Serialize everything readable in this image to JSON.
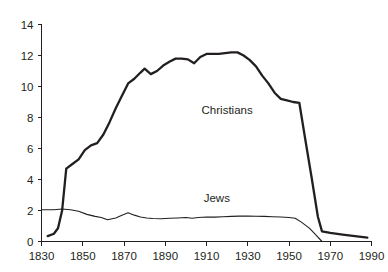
{
  "chart_data": {
    "type": "line",
    "title": "",
    "subtitle": "",
    "xlabel": "",
    "ylabel": "",
    "xlim": [
      1830,
      1990
    ],
    "ylim": [
      0,
      14
    ],
    "xticks": [
      1830,
      1850,
      1870,
      1890,
      1910,
      1930,
      1950,
      1970,
      1990
    ],
    "yticks": [
      0,
      2,
      4,
      6,
      8,
      10,
      12,
      14
    ],
    "xtick_labels": [
      "1830",
      "1850",
      "1870",
      "1890",
      "1910",
      "1930",
      "1950",
      "1970",
      "1990"
    ],
    "ytick_labels": [
      "0",
      "2",
      "4",
      "6",
      "8",
      "10",
      "12",
      "14"
    ],
    "grid": false,
    "legend_position": "inline-annotations",
    "line_color": "#231f20",
    "background_color": "#ffffff",
    "series": [
      {
        "name": "Christians",
        "label": "Christians",
        "label_x": 1920,
        "label_y": 8.2,
        "stroke_width": 2.3,
        "x": [
          1833,
          1836,
          1838,
          1840,
          1842,
          1845,
          1848,
          1851,
          1854,
          1857,
          1860,
          1863,
          1866,
          1869,
          1872,
          1875,
          1878,
          1880,
          1883,
          1886,
          1889,
          1892,
          1895,
          1898,
          1901,
          1904,
          1907,
          1910,
          1913,
          1916,
          1919,
          1922,
          1925,
          1928,
          1931,
          1934,
          1937,
          1940,
          1943,
          1946,
          1949,
          1952,
          1955,
          1958,
          1961,
          1964,
          1966,
          1970,
          1976,
          1982,
          1988
        ],
        "values": [
          0.35,
          0.5,
          0.85,
          2.0,
          4.7,
          5.0,
          5.3,
          5.9,
          6.2,
          6.35,
          6.9,
          7.7,
          8.6,
          9.4,
          10.2,
          10.5,
          10.9,
          11.15,
          10.8,
          11.0,
          11.35,
          11.6,
          11.8,
          11.8,
          11.75,
          11.5,
          11.9,
          12.1,
          12.1,
          12.1,
          12.15,
          12.2,
          12.2,
          12.0,
          11.7,
          11.3,
          10.7,
          10.2,
          9.6,
          9.2,
          9.1,
          9.0,
          8.95,
          6.5,
          4.1,
          1.6,
          0.65,
          0.55,
          0.45,
          0.35,
          0.25
        ]
      },
      {
        "name": "Jews",
        "label": "Jews",
        "label_x": 1915,
        "label_y": 2.55,
        "stroke_width": 1.1,
        "x": [
          1830,
          1836,
          1840,
          1844,
          1848,
          1852,
          1856,
          1859,
          1862,
          1866,
          1869,
          1872,
          1875,
          1878,
          1881,
          1884,
          1888,
          1892,
          1896,
          1900,
          1903,
          1906,
          1910,
          1914,
          1918,
          1922,
          1926,
          1930,
          1934,
          1938,
          1942,
          1946,
          1950,
          1953,
          1956,
          1960,
          1963,
          1966
        ],
        "values": [
          2.05,
          2.05,
          2.1,
          2.05,
          1.95,
          1.75,
          1.62,
          1.55,
          1.4,
          1.52,
          1.7,
          1.85,
          1.7,
          1.58,
          1.52,
          1.48,
          1.47,
          1.5,
          1.52,
          1.55,
          1.5,
          1.55,
          1.58,
          1.57,
          1.6,
          1.62,
          1.64,
          1.65,
          1.63,
          1.62,
          1.6,
          1.58,
          1.55,
          1.5,
          1.25,
          0.85,
          0.42,
          0.0
        ]
      }
    ]
  }
}
